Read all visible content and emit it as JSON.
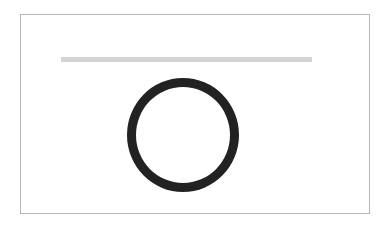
{
  "canvas": {
    "frame_color": "#b5b5b5",
    "bar_color": "#d4d4d4",
    "ring_color": "#222222"
  },
  "elements": {
    "bar": {
      "shape": "horizontal-bar"
    },
    "ring": {
      "shape": "circle-outline"
    }
  }
}
